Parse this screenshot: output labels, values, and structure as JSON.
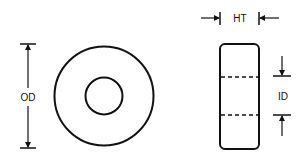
{
  "diagram": {
    "type": "toroid-core-dimensions",
    "views": {
      "front": {
        "shape": "ring",
        "outer_label": "OD"
      },
      "side": {
        "shape": "rounded-rectangle",
        "height_label": "HT",
        "inner_label": "ID"
      }
    },
    "labels": {
      "od": "OD",
      "ht": "HT",
      "id": "ID"
    },
    "colors": {
      "stroke": "#111111",
      "background": "#ffffff"
    }
  }
}
